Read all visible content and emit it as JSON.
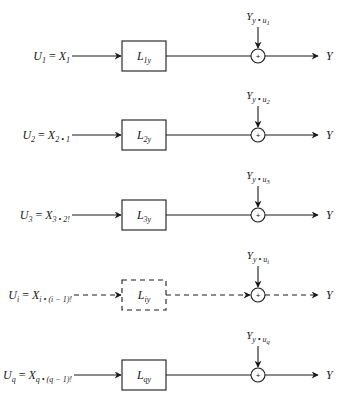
{
  "diagram": {
    "type": "block-diagram",
    "stroke_color": "#1a1a1a",
    "background": "#ffffff",
    "rows": [
      {
        "input": {
          "U": "U",
          "U_sub": "1",
          "eq": " = ",
          "X": "X",
          "X_sub": "1",
          "X_sub2": ""
        },
        "block": {
          "L": "L",
          "L_sub": "1y"
        },
        "feed": {
          "Y": "Y",
          "Y_sub": "y • u",
          "Y_sub2": "1"
        },
        "sum_sign": "+",
        "output": "Y",
        "dashed": false
      },
      {
        "input": {
          "U": "U",
          "U_sub": "2",
          "eq": " = ",
          "X": "X",
          "X_sub": "2 • 1",
          "X_sub2": ""
        },
        "block": {
          "L": "L",
          "L_sub": "2y"
        },
        "feed": {
          "Y": "Y",
          "Y_sub": "y • u",
          "Y_sub2": "2"
        },
        "sum_sign": "+",
        "output": "Y",
        "dashed": false
      },
      {
        "input": {
          "U": "U",
          "U_sub": "3",
          "eq": " = ",
          "X": "X",
          "X_sub": "3 • 2!",
          "X_sub2": ""
        },
        "block": {
          "L": "L",
          "L_sub": "3y"
        },
        "feed": {
          "Y": "Y",
          "Y_sub": "y • u",
          "Y_sub2": "3"
        },
        "sum_sign": "+",
        "output": "Y",
        "dashed": false
      },
      {
        "input": {
          "U": "U",
          "U_sub": "i",
          "eq": " = ",
          "X": "X",
          "X_sub": "i • (i − 1)!",
          "X_sub2": ""
        },
        "block": {
          "L": "L",
          "L_sub": "iy"
        },
        "feed": {
          "Y": "Y",
          "Y_sub": "y • u",
          "Y_sub2": "i"
        },
        "sum_sign": "+",
        "output": "Y",
        "dashed": true
      },
      {
        "input": {
          "U": "U",
          "U_sub": "q",
          "eq": " = ",
          "X": "X",
          "X_sub": "q • (q − 1)!",
          "X_sub2": ""
        },
        "block": {
          "L": "L",
          "L_sub": "qy"
        },
        "feed": {
          "Y": "Y",
          "Y_sub": "y • u",
          "Y_sub2": "q"
        },
        "sum_sign": "+",
        "output": "Y",
        "dashed": false
      }
    ]
  }
}
